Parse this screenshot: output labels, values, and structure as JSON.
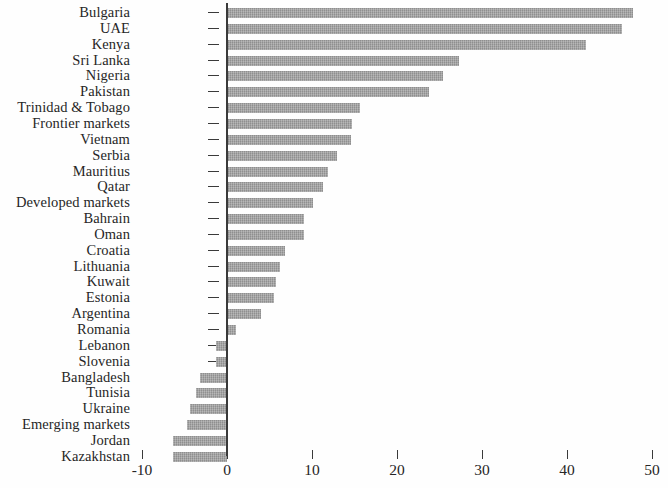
{
  "chart_data": {
    "type": "bar",
    "orientation": "horizontal",
    "title": "",
    "subtitle": "",
    "xlabel": "",
    "ylabel": "",
    "xlim": [
      -10,
      50
    ],
    "xticks": [
      -10,
      0,
      10,
      20,
      30,
      40,
      50
    ],
    "xtick_labels": [
      "-10",
      "0",
      "10",
      "20",
      "30",
      "40",
      "50"
    ],
    "grid": false,
    "legend": false,
    "bar_color": "#9d9d9d",
    "axis_color": "#3a3a3a",
    "categories": [
      "Bulgaria",
      "UAE",
      "Kenya",
      "Sri Lanka",
      "Nigeria",
      "Pakistan",
      "Trinidad & Tobago",
      "Frontier markets",
      "Vietnam",
      "Serbia",
      "Mauritius",
      "Qatar",
      "Developed markets",
      "Bahrain",
      "Oman",
      "Croatia",
      "Lithuania",
      "Kuwait",
      "Estonia",
      "Argentina",
      "Romania",
      "Lebanon",
      "Slovenia",
      "Bangladesh",
      "Tunisia",
      "Ukraine",
      "Emerging markets",
      "Jordan",
      "Kazakhstan"
    ],
    "values": [
      47.8,
      46.5,
      42.2,
      27.3,
      25.4,
      23.8,
      15.6,
      14.7,
      14.6,
      12.9,
      11.9,
      11.3,
      10.1,
      9.1,
      9.0,
      6.8,
      6.2,
      5.8,
      5.5,
      4.0,
      1.1,
      -1.3,
      -1.3,
      -3.2,
      -3.6,
      -4.3,
      -4.7,
      -6.3,
      -6.3
    ]
  }
}
